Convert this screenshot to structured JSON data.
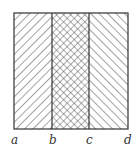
{
  "diagram": {
    "type": "hatched-regions",
    "regions": [
      {
        "name": "left",
        "from": "a",
        "to": "b",
        "pattern": "forward-diagonal-hatch"
      },
      {
        "name": "middle",
        "from": "b",
        "to": "c",
        "pattern": "crosshatch"
      },
      {
        "name": "right",
        "from": "c",
        "to": "d",
        "pattern": "backward-diagonal-hatch"
      }
    ],
    "labels": {
      "a": "a",
      "b": "b",
      "c": "c",
      "d": "d"
    },
    "stroke_color": "#333333"
  }
}
